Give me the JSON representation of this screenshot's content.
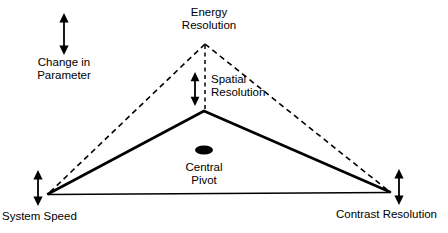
{
  "diagram": {
    "title_visible": false,
    "background_color": "#ffffff",
    "stroke_color": "#000000",
    "labels": {
      "change_in_parameter": {
        "line1": "Change in",
        "line2": "Parameter"
      },
      "energy_resolution": {
        "line1": "Energy",
        "line2": "Resolution"
      },
      "spatial_resolution": {
        "line1": "Spatial",
        "line2": "Resolution"
      },
      "central_pivot": {
        "line1": "Central",
        "line2": "Pivot"
      },
      "system_speed": {
        "line1": "System Speed"
      },
      "contrast_resolution": {
        "line1": "Contrast Resolution"
      }
    },
    "icons": {
      "legend_arrow": "double-headed-vertical-arrow-icon",
      "spatial_arrow": "double-headed-vertical-arrow-icon",
      "left_vertex_arrow": "double-headed-vertical-arrow-icon",
      "right_vertex_arrow": "double-headed-vertical-arrow-icon",
      "pivot_marker": "filled-ellipse-icon"
    },
    "geometry": {
      "solid_triangle_apex": [
        204,
        111
      ],
      "dashed_triangle_apex": [
        205,
        43
      ],
      "left_vertex": [
        48,
        194
      ],
      "right_vertex": [
        390,
        192
      ],
      "pivot_marker_center": [
        204,
        150
      ]
    }
  }
}
